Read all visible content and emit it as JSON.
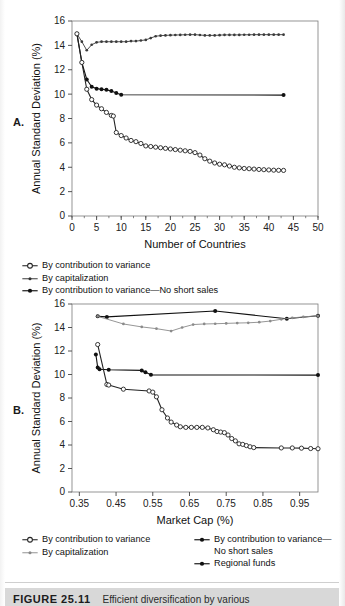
{
  "figure": {
    "number": "FIGURE 25.11",
    "caption": "Efficient diversification by various"
  },
  "panels": [
    {
      "letter": "A.",
      "legend": [
        {
          "label": "By contribution to variance",
          "marker": "open-circle-line"
        },
        {
          "label": "By capitalization",
          "marker": "small-dot-line"
        },
        {
          "label": "By contribution to variance—No short sales",
          "marker": "filled-dot-line"
        }
      ]
    },
    {
      "letter": "B.",
      "legend_left": [
        {
          "label": "By contribution to variance",
          "marker": "open-circle-line"
        },
        {
          "label": "By capitalization",
          "marker": "small-dot-line"
        }
      ],
      "legend_right": [
        {
          "label": "By contribution to variance—No short sales",
          "marker": "filled-dot-line"
        },
        {
          "label": "Regional funds",
          "marker": "filled-dot-line"
        }
      ]
    }
  ],
  "chart_data": [
    {
      "type": "line",
      "panel": "A",
      "title": "",
      "xlabel": "Number of Countries",
      "ylabel": "Annual Standard Deviation (%)",
      "xlim": [
        0,
        50
      ],
      "ylim": [
        0,
        16
      ],
      "xticks": [
        0,
        5,
        10,
        15,
        20,
        25,
        30,
        35,
        40,
        45,
        50
      ],
      "yticks": [
        0,
        2,
        4,
        6,
        8,
        10,
        12,
        14,
        16
      ],
      "grid": false,
      "legend_position": "below",
      "series": [
        {
          "name": "By capitalization",
          "marker": "small-dot",
          "color": "#3a3a3a",
          "x": [
            1,
            2,
            3,
            4,
            5,
            6,
            7,
            8,
            9,
            10,
            11,
            12,
            13,
            14,
            15,
            16,
            17,
            18,
            19,
            20,
            21,
            22,
            23,
            24,
            25,
            26,
            27,
            28,
            29,
            30,
            31,
            32,
            33,
            34,
            35,
            36,
            37,
            38,
            39,
            40,
            41,
            42,
            43
          ],
          "y": [
            14.95,
            14.3,
            13.6,
            14.05,
            14.25,
            14.3,
            14.3,
            14.3,
            14.3,
            14.3,
            14.3,
            14.35,
            14.35,
            14.4,
            14.45,
            14.6,
            14.75,
            14.8,
            14.82,
            14.84,
            14.85,
            14.86,
            14.87,
            14.88,
            14.88,
            14.85,
            14.82,
            14.82,
            14.82,
            14.84,
            14.86,
            14.86,
            14.86,
            14.86,
            14.87,
            14.87,
            14.88,
            14.88,
            14.88,
            14.88,
            14.88,
            14.88,
            14.88
          ]
        },
        {
          "name": "By contribution to variance—No short sales",
          "marker": "filled-dot",
          "color": "#111111",
          "x": [
            1,
            2,
            3,
            4,
            5,
            6,
            7,
            8,
            9,
            10,
            43
          ],
          "y": [
            14.95,
            12.6,
            11.2,
            10.6,
            10.45,
            10.4,
            10.35,
            10.25,
            10.1,
            9.95,
            9.92
          ]
        },
        {
          "name": "By contribution to variance",
          "marker": "open-circle",
          "color": "#222222",
          "x": [
            1,
            2,
            3,
            4,
            5,
            6,
            7,
            8,
            8.4,
            9,
            10,
            11,
            12,
            13,
            14,
            15,
            16,
            17,
            18,
            19,
            20,
            21,
            22,
            23,
            24,
            25,
            26,
            27,
            28,
            29,
            30,
            31,
            32,
            33,
            34,
            35,
            36,
            37,
            38,
            39,
            40,
            41,
            42,
            43
          ],
          "y": [
            14.95,
            12.6,
            10.4,
            9.55,
            9.1,
            8.8,
            8.5,
            8.25,
            8.2,
            6.85,
            6.6,
            6.4,
            6.2,
            6.1,
            5.95,
            5.75,
            5.7,
            5.65,
            5.6,
            5.55,
            5.5,
            5.45,
            5.4,
            5.35,
            5.3,
            5.2,
            5.0,
            4.7,
            4.5,
            4.35,
            4.25,
            4.2,
            4.1,
            4.0,
            3.95,
            3.9,
            3.88,
            3.85,
            3.82,
            3.8,
            3.78,
            3.76,
            3.75,
            3.74
          ]
        }
      ]
    },
    {
      "type": "line",
      "panel": "B",
      "title": "",
      "xlabel": "Market Cap (%)",
      "ylabel": "Annual Standard Deviation (%)",
      "xlim": [
        0.33,
        1.0
      ],
      "ylim": [
        0,
        16
      ],
      "xticks": [
        0.35,
        0.45,
        0.55,
        0.65,
        0.75,
        0.85,
        0.95
      ],
      "yticks": [
        0,
        2,
        4,
        6,
        8,
        10,
        12,
        14,
        16
      ],
      "grid": false,
      "legend_position": "below",
      "series": [
        {
          "name": "Regional funds",
          "marker": "filled-dot",
          "color": "#111111",
          "x": [
            0.4,
            0.425,
            0.72,
            0.915,
            1.0
          ],
          "y": [
            14.95,
            14.9,
            15.4,
            14.75,
            15.0
          ]
        },
        {
          "name": "By capitalization",
          "marker": "small-dot",
          "color": "#8a8a8a",
          "x": [
            0.4,
            0.47,
            0.52,
            0.56,
            0.6,
            0.63,
            0.66,
            0.69,
            0.72,
            0.75,
            0.78,
            0.81,
            0.84,
            0.87,
            0.9,
            0.93,
            0.96,
            1.0
          ],
          "y": [
            14.95,
            14.3,
            14.05,
            13.9,
            13.7,
            14.0,
            14.25,
            14.3,
            14.32,
            14.35,
            14.38,
            14.4,
            14.45,
            14.55,
            14.7,
            14.82,
            14.9,
            15.0
          ]
        },
        {
          "name": "By contribution to variance—No short sales",
          "marker": "filled-dot",
          "color": "#111111",
          "x": [
            0.395,
            0.4,
            0.405,
            0.43,
            0.52,
            0.53,
            0.545,
            1.0
          ],
          "y": [
            11.7,
            10.6,
            10.45,
            10.4,
            10.35,
            10.2,
            9.97,
            9.95
          ]
        },
        {
          "name": "By contribution to variance",
          "marker": "open-circle",
          "color": "#222222",
          "x": [
            0.4,
            0.425,
            0.43,
            0.47,
            0.54,
            0.55,
            0.56,
            0.575,
            0.59,
            0.6,
            0.615,
            0.625,
            0.64,
            0.655,
            0.67,
            0.685,
            0.7,
            0.715,
            0.725,
            0.735,
            0.745,
            0.755,
            0.765,
            0.775,
            0.785,
            0.795,
            0.805,
            0.815,
            0.825,
            0.9,
            0.93,
            0.955,
            0.98,
            1.0
          ],
          "y": [
            12.55,
            9.15,
            9.1,
            8.75,
            8.6,
            8.5,
            8.1,
            7.0,
            6.3,
            5.95,
            5.7,
            5.55,
            5.5,
            5.5,
            5.5,
            5.5,
            5.45,
            5.3,
            5.15,
            5.1,
            5.05,
            4.85,
            4.55,
            4.35,
            4.1,
            4.05,
            3.95,
            3.85,
            3.78,
            3.75,
            3.75,
            3.73,
            3.7,
            3.68
          ]
        }
      ]
    }
  ]
}
